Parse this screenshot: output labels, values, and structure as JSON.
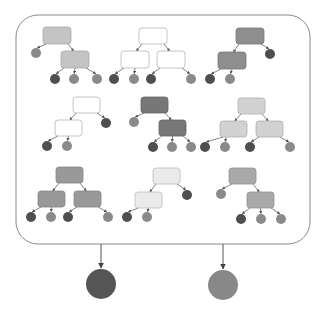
{
  "colors": {
    "frame": "#8a8a8a",
    "edge": "#666666",
    "leaf_dark": "#4f4f4f",
    "leaf_mid": "#8a8a8a",
    "output_left": "#555555",
    "output_right": "#888888"
  },
  "frame": {
    "x": 16,
    "y": 15,
    "w": 294,
    "h": 229,
    "r": 22
  },
  "trees": [
    {
      "id": "tree-1",
      "fill": "#c4c4c4",
      "stroke": "#a9a9a9",
      "nodes": [
        {
          "id": "root",
          "x": 43,
          "y": 27,
          "w": 28,
          "h": 17
        },
        {
          "id": "child",
          "x": 61,
          "y": 51,
          "w": 28,
          "h": 17
        }
      ],
      "leaves": [
        {
          "cx": 36,
          "cy": 53,
          "tone": "mid",
          "from": "root"
        },
        {
          "cx": 55,
          "cy": 79,
          "tone": "dark",
          "from": "child"
        },
        {
          "cx": 74,
          "cy": 79,
          "tone": "mid",
          "from": "child"
        },
        {
          "cx": 97,
          "cy": 79,
          "tone": "mid",
          "from": "child"
        }
      ],
      "edges": [
        [
          "root",
          "child"
        ]
      ]
    },
    {
      "id": "tree-2",
      "fill": "#ffffff",
      "stroke": "#b5b5b5",
      "nodes": [
        {
          "id": "root",
          "x": 139,
          "y": 28,
          "w": 28,
          "h": 16
        },
        {
          "id": "left",
          "x": 121,
          "y": 51,
          "w": 28,
          "h": 17
        },
        {
          "id": "right",
          "x": 157,
          "y": 51,
          "w": 28,
          "h": 17
        }
      ],
      "leaves": [
        {
          "cx": 114,
          "cy": 79,
          "tone": "dark",
          "from": "left"
        },
        {
          "cx": 134,
          "cy": 79,
          "tone": "mid",
          "from": "left"
        },
        {
          "cx": 151,
          "cy": 79,
          "tone": "dark",
          "from": "right"
        },
        {
          "cx": 191,
          "cy": 79,
          "tone": "mid",
          "from": "right"
        }
      ],
      "edges": [
        [
          "root",
          "left"
        ],
        [
          "root",
          "right"
        ]
      ]
    },
    {
      "id": "tree-3",
      "fill": "#8e8e8e",
      "stroke": "#7a7a7a",
      "nodes": [
        {
          "id": "root",
          "x": 236,
          "y": 28,
          "w": 28,
          "h": 16
        },
        {
          "id": "child",
          "x": 218,
          "y": 52,
          "w": 28,
          "h": 17
        }
      ],
      "leaves": [
        {
          "cx": 270,
          "cy": 54,
          "tone": "dark",
          "from": "root"
        },
        {
          "cx": 210,
          "cy": 79,
          "tone": "dark",
          "from": "child"
        },
        {
          "cx": 230,
          "cy": 79,
          "tone": "mid",
          "from": "child"
        }
      ],
      "edges": [
        [
          "root",
          "child"
        ]
      ]
    },
    {
      "id": "tree-4",
      "fill": "#ffffff",
      "stroke": "#b5b5b5",
      "nodes": [
        {
          "id": "root",
          "x": 73,
          "y": 97,
          "w": 27,
          "h": 16
        },
        {
          "id": "child",
          "x": 55,
          "y": 120,
          "w": 27,
          "h": 16
        }
      ],
      "leaves": [
        {
          "cx": 106,
          "cy": 123,
          "tone": "dark",
          "from": "root"
        },
        {
          "cx": 47,
          "cy": 146,
          "tone": "dark",
          "from": "child"
        },
        {
          "cx": 67,
          "cy": 146,
          "tone": "mid",
          "from": "child"
        }
      ],
      "edges": [
        [
          "root",
          "child"
        ]
      ]
    },
    {
      "id": "tree-5",
      "fill": "#777777",
      "stroke": "#666666",
      "nodes": [
        {
          "id": "root",
          "x": 141,
          "y": 97,
          "w": 27,
          "h": 16
        },
        {
          "id": "child",
          "x": 159,
          "y": 120,
          "w": 27,
          "h": 16
        }
      ],
      "leaves": [
        {
          "cx": 134,
          "cy": 122,
          "tone": "mid",
          "from": "root"
        },
        {
          "cx": 153,
          "cy": 147,
          "tone": "dark",
          "from": "child"
        },
        {
          "cx": 172,
          "cy": 147,
          "tone": "mid",
          "from": "child"
        },
        {
          "cx": 191,
          "cy": 147,
          "tone": "mid",
          "from": "child"
        }
      ],
      "edges": [
        [
          "root",
          "child"
        ]
      ]
    },
    {
      "id": "tree-6",
      "fill": "#d2d2d2",
      "stroke": "#b0b0b0",
      "nodes": [
        {
          "id": "root",
          "x": 238,
          "y": 98,
          "w": 27,
          "h": 16
        },
        {
          "id": "left",
          "x": 220,
          "y": 121,
          "w": 27,
          "h": 16
        },
        {
          "id": "right",
          "x": 256,
          "y": 121,
          "w": 27,
          "h": 16
        }
      ],
      "leaves": [
        {
          "cx": 205,
          "cy": 147,
          "tone": "dark",
          "from": "left"
        },
        {
          "cx": 225,
          "cy": 147,
          "tone": "mid",
          "from": "left"
        },
        {
          "cx": 250,
          "cy": 147,
          "tone": "dark",
          "from": "right"
        },
        {
          "cx": 290,
          "cy": 147,
          "tone": "mid",
          "from": "right"
        }
      ],
      "edges": [
        [
          "root",
          "left"
        ],
        [
          "root",
          "right"
        ]
      ]
    },
    {
      "id": "tree-7",
      "fill": "#999999",
      "stroke": "#858585",
      "nodes": [
        {
          "id": "root",
          "x": 56,
          "y": 167,
          "w": 27,
          "h": 16
        },
        {
          "id": "left",
          "x": 38,
          "y": 191,
          "w": 27,
          "h": 16
        },
        {
          "id": "right",
          "x": 74,
          "y": 191,
          "w": 27,
          "h": 16
        }
      ],
      "leaves": [
        {
          "cx": 31,
          "cy": 217,
          "tone": "dark",
          "from": "left"
        },
        {
          "cx": 51,
          "cy": 217,
          "tone": "mid",
          "from": "left"
        },
        {
          "cx": 68,
          "cy": 217,
          "tone": "dark",
          "from": "right"
        },
        {
          "cx": 108,
          "cy": 217,
          "tone": "mid",
          "from": "right"
        }
      ],
      "edges": [
        [
          "root",
          "left"
        ],
        [
          "root",
          "right"
        ]
      ]
    },
    {
      "id": "tree-8",
      "fill": "#ebebeb",
      "stroke": "#bdbdbd",
      "nodes": [
        {
          "id": "root",
          "x": 153,
          "y": 168,
          "w": 27,
          "h": 16
        },
        {
          "id": "child",
          "x": 135,
          "y": 192,
          "w": 27,
          "h": 16
        }
      ],
      "leaves": [
        {
          "cx": 187,
          "cy": 195,
          "tone": "dark",
          "from": "root"
        },
        {
          "cx": 127,
          "cy": 217,
          "tone": "dark",
          "from": "child"
        },
        {
          "cx": 147,
          "cy": 217,
          "tone": "mid",
          "from": "child"
        }
      ],
      "edges": [
        [
          "root",
          "child"
        ]
      ]
    },
    {
      "id": "tree-9",
      "fill": "#a9a9a9",
      "stroke": "#939393",
      "nodes": [
        {
          "id": "root",
          "x": 229,
          "y": 168,
          "w": 27,
          "h": 16
        },
        {
          "id": "child",
          "x": 247,
          "y": 192,
          "w": 27,
          "h": 16
        }
      ],
      "leaves": [
        {
          "cx": 221,
          "cy": 194,
          "tone": "mid",
          "from": "root"
        },
        {
          "cx": 241,
          "cy": 219,
          "tone": "dark",
          "from": "child"
        },
        {
          "cx": 261,
          "cy": 219,
          "tone": "mid",
          "from": "child"
        },
        {
          "cx": 281,
          "cy": 219,
          "tone": "mid",
          "from": "child"
        }
      ],
      "edges": [
        [
          "root",
          "child"
        ]
      ]
    }
  ],
  "leaf_radius": 5,
  "outputs": [
    {
      "id": "output-left",
      "cx": 101,
      "cy": 284,
      "r": 15,
      "tone": "output_left",
      "arrow_x": 101
    },
    {
      "id": "output-right",
      "cx": 223,
      "cy": 285,
      "r": 15,
      "tone": "output_right",
      "arrow_x": 223
    }
  ]
}
